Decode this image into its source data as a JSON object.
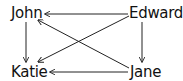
{
  "diagram": {
    "type": "directed-graph",
    "nodes": [
      {
        "id": "john",
        "label": "John"
      },
      {
        "id": "edward",
        "label": "Edward"
      },
      {
        "id": "katie",
        "label": "Katie"
      },
      {
        "id": "jane",
        "label": "Jane"
      }
    ],
    "edges": [
      {
        "from": "Edward",
        "to": "John"
      },
      {
        "from": "Edward",
        "to": "Katie"
      },
      {
        "from": "Edward",
        "to": "Jane"
      },
      {
        "from": "Jane",
        "to": "John"
      },
      {
        "from": "Jane",
        "to": "Katie"
      },
      {
        "from": "John",
        "to": "Katie"
      }
    ],
    "colors": {
      "line": "#222222",
      "text": "#111111",
      "background": "#ffffff"
    }
  }
}
